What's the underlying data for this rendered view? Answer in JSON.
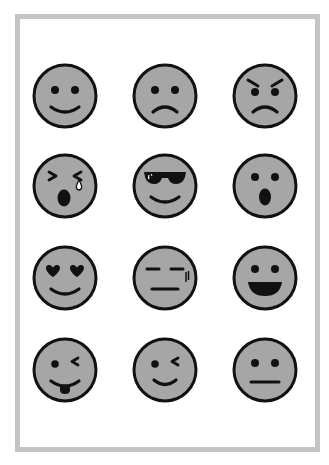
{
  "colors": {
    "frame_border": "#c4c4c4",
    "background": "#ffffff",
    "face_fill": "#a6a6a6",
    "stroke": "#111111"
  },
  "grid": {
    "columns": [
      65,
      165,
      265
    ],
    "rows": [
      96,
      186,
      278,
      370
    ],
    "diameter": 64
  },
  "emojis": [
    {
      "name": "smiling-face",
      "label": "Smiling face",
      "type": "smile",
      "row": 0,
      "col": 0
    },
    {
      "name": "sad-face",
      "label": "Sad face",
      "type": "sad",
      "row": 0,
      "col": 1
    },
    {
      "name": "angry-face",
      "label": "Angry face",
      "type": "angry",
      "row": 0,
      "col": 2
    },
    {
      "name": "crying-face",
      "label": "Crying face with tear",
      "type": "cry",
      "row": 1,
      "col": 0
    },
    {
      "name": "sunglasses-face",
      "label": "Smiling face with sunglasses",
      "type": "cool",
      "row": 1,
      "col": 1
    },
    {
      "name": "surprised-face",
      "label": "Surprised face",
      "type": "surprised",
      "row": 1,
      "col": 2
    },
    {
      "name": "heart-eyes-face",
      "label": "Heart eyes face",
      "type": "hearts",
      "row": 2,
      "col": 0
    },
    {
      "name": "unamused-face",
      "label": "Unamused face",
      "type": "unamused",
      "row": 2,
      "col": 1
    },
    {
      "name": "grinning-face",
      "label": "Grinning face with open mouth",
      "type": "grin",
      "row": 2,
      "col": 2
    },
    {
      "name": "winking-tongue-face",
      "label": "Winking face with tongue",
      "type": "tongue",
      "row": 3,
      "col": 0
    },
    {
      "name": "winking-face",
      "label": "Winking face",
      "type": "wink",
      "row": 3,
      "col": 1
    },
    {
      "name": "neutral-face",
      "label": "Neutral face",
      "type": "neutral",
      "row": 3,
      "col": 2
    }
  ]
}
